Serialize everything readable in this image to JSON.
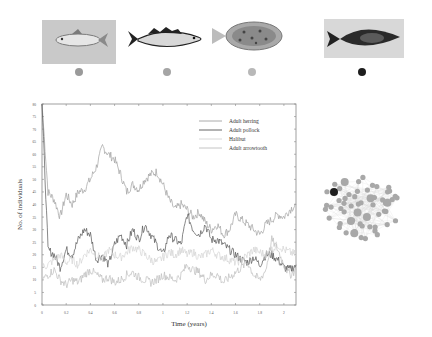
{
  "species": [
    {
      "name": "Adult herring",
      "marker_color": "#9a9a9a",
      "image_bg": "#c9c9c9"
    },
    {
      "name": "Adult pollock",
      "marker_color": "#a5a5a5",
      "image_bg": "#ffffff"
    },
    {
      "name": "Halibut",
      "marker_color": "#b8b8b8",
      "image_bg": "#ffffff"
    },
    {
      "name": "Adult arrowtooth",
      "marker_color": "#1e1e1e",
      "image_bg": "#d8d8d8"
    }
  ],
  "chart_data": {
    "type": "line",
    "title": "",
    "xlabel": "Time (years)",
    "ylabel": "No. of individuals",
    "xlim": [
      0,
      2.1
    ],
    "ylim": [
      0,
      80
    ],
    "x_ticks": [
      "0",
      "0.2",
      "0.4",
      "0.6",
      "0.8",
      "1",
      "1.2",
      "1.4",
      "1.6",
      "1.8",
      "2"
    ],
    "y_ticks": [
      "0",
      "5",
      "10",
      "15",
      "20",
      "25",
      "30",
      "35",
      "40",
      "45",
      "50",
      "55",
      "60",
      "65",
      "70",
      "75",
      "80"
    ],
    "grid": false,
    "legend_position": "upper right",
    "x": [
      0,
      0.05,
      0.1,
      0.15,
      0.2,
      0.25,
      0.3,
      0.35,
      0.4,
      0.45,
      0.5,
      0.55,
      0.6,
      0.65,
      0.7,
      0.75,
      0.8,
      0.85,
      0.9,
      0.95,
      1.0,
      1.05,
      1.1,
      1.15,
      1.2,
      1.25,
      1.3,
      1.35,
      1.4,
      1.45,
      1.5,
      1.55,
      1.6,
      1.65,
      1.7,
      1.75,
      1.8,
      1.85,
      1.9,
      1.95,
      2.0,
      2.05,
      2.1
    ],
    "series": [
      {
        "name": "Adult herring",
        "color": "#a0a0a0",
        "values": [
          80,
          45,
          42,
          35,
          44,
          40,
          45,
          46,
          50,
          55,
          63,
          60,
          58,
          52,
          45,
          48,
          46,
          50,
          52,
          53,
          48,
          42,
          38,
          40,
          38,
          35,
          37,
          33,
          30,
          32,
          28,
          30,
          36,
          34,
          32,
          30,
          28,
          32,
          34,
          36,
          35,
          38,
          40
        ]
      },
      {
        "name": "Adult pollock",
        "color": "#555555",
        "values": [
          80,
          22,
          20,
          15,
          22,
          20,
          26,
          30,
          28,
          18,
          20,
          16,
          24,
          28,
          24,
          30,
          26,
          32,
          28,
          24,
          20,
          28,
          26,
          24,
          36,
          30,
          28,
          32,
          26,
          26,
          24,
          22,
          20,
          18,
          17,
          19,
          16,
          20,
          20,
          18,
          15,
          14,
          16
        ]
      },
      {
        "name": "Halibut",
        "color": "#d4d4d4",
        "values": [
          15,
          16,
          18,
          20,
          17,
          18,
          16,
          20,
          22,
          20,
          18,
          22,
          20,
          19,
          21,
          23,
          22,
          20,
          18,
          17,
          19,
          21,
          20,
          22,
          20,
          21,
          19,
          20,
          22,
          20,
          19,
          18,
          17,
          18,
          20,
          22,
          21,
          20,
          22,
          24,
          22,
          21,
          20
        ]
      },
      {
        "name": "Adult arrowtooth",
        "color": "#bdbdbd",
        "values": [
          10,
          12,
          14,
          10,
          8,
          10,
          9,
          12,
          14,
          12,
          10,
          11,
          9,
          10,
          12,
          13,
          11,
          10,
          9,
          10,
          12,
          11,
          10,
          12,
          16,
          14,
          13,
          10,
          12,
          12,
          9,
          11,
          13,
          15,
          17,
          12,
          10,
          14,
          26,
          22,
          16,
          12,
          14
        ]
      }
    ]
  },
  "network": {
    "highlight_color": "#1e1e1e",
    "node_color": "#a8a8a8",
    "edge_color": "#d8d8d8"
  }
}
